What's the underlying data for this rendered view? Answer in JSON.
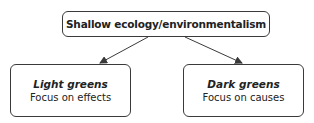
{
  "diagram": {
    "root": {
      "label": "Shallow ecology/environmentalism"
    },
    "children": [
      {
        "title": "Light greens",
        "subtitle": "Focus on effects"
      },
      {
        "title": "Dark greens",
        "subtitle": "Focus on causes"
      }
    ],
    "colors": {
      "stroke": "#3a3a3a",
      "text": "#222222",
      "background": "#ffffff"
    }
  }
}
